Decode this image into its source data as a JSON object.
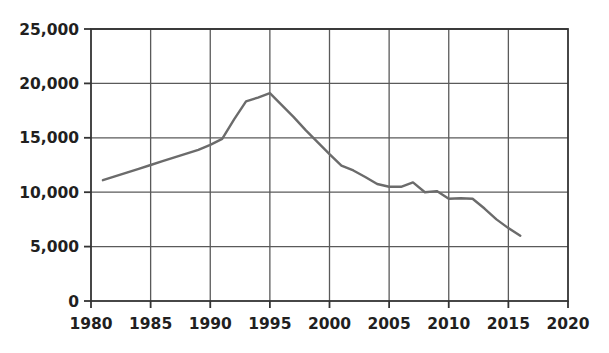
{
  "chart_data": {
    "type": "line",
    "title": "",
    "subtitle": "",
    "xlabel": "",
    "ylabel": "",
    "xlim": [
      1980,
      2020
    ],
    "ylim": [
      0,
      25000
    ],
    "grid": true,
    "legend": false,
    "legend_position": "none",
    "line_color": "#6b6b6b",
    "axis_color": "#333333",
    "gridline_color": "#5a5a5a",
    "x_ticks": [
      1980,
      1985,
      1990,
      1995,
      2000,
      2005,
      2010,
      2015,
      2020
    ],
    "x_tick_labels": [
      "1980",
      "1985",
      "1990",
      "1995",
      "2000",
      "2005",
      "2010",
      "2015",
      "2020"
    ],
    "y_ticks": [
      0,
      5000,
      10000,
      15000,
      20000,
      25000
    ],
    "y_tick_labels": [
      "0",
      "5,000",
      "10,000",
      "15,000",
      "20,000",
      "25,000"
    ],
    "series": [
      {
        "name": "series-1",
        "x": [
          1981,
          1982,
          1983,
          1984,
          1985,
          1986,
          1987,
          1988,
          1989,
          1990,
          1991,
          1992,
          1993,
          1994,
          1995,
          1996,
          1997,
          1998,
          1999,
          2000,
          2001,
          2002,
          2003,
          2004,
          2005,
          2006,
          2007,
          2008,
          2009,
          2010,
          2011,
          2012,
          2013,
          2014,
          2015,
          2016
        ],
        "values": [
          11100,
          11450,
          11800,
          12150,
          12500,
          12850,
          13200,
          13550,
          13900,
          14350,
          14900,
          16700,
          18350,
          18700,
          19100,
          18000,
          16900,
          15700,
          14600,
          13500,
          12450,
          12000,
          11400,
          10750,
          10500,
          10500,
          10900,
          10000,
          10100,
          9400,
          9450,
          9400,
          8500,
          7500,
          6700,
          6000
        ]
      }
    ]
  }
}
